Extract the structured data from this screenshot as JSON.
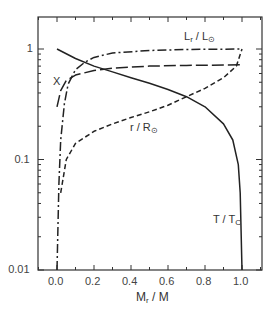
{
  "chart_data": {
    "type": "line",
    "title": "",
    "xlabel": "M_r / M",
    "ylabel": "",
    "xlim": [
      -0.1,
      1.1
    ],
    "ylim": [
      0.01,
      2
    ],
    "yscale": "log",
    "grid": false,
    "legend": "inline labels",
    "xticks": [
      "0.0",
      "0.2",
      "0.4",
      "0.6",
      "0.8",
      "1.0"
    ],
    "yticks": [
      "0.01",
      "0.1",
      "1"
    ],
    "series": [
      {
        "name": "T / T_c",
        "style": "solid",
        "x": [
          0.0,
          0.1,
          0.2,
          0.3,
          0.4,
          0.5,
          0.6,
          0.7,
          0.8,
          0.9,
          0.95,
          0.98,
          0.99,
          1.0
        ],
        "y": [
          1.0,
          0.82,
          0.7,
          0.62,
          0.55,
          0.49,
          0.43,
          0.37,
          0.3,
          0.21,
          0.15,
          0.09,
          0.05,
          0.01
        ]
      },
      {
        "name": "r / R_sun",
        "style": "short-dashed",
        "x": [
          0.02,
          0.05,
          0.1,
          0.2,
          0.3,
          0.4,
          0.5,
          0.6,
          0.7,
          0.8,
          0.9,
          0.97,
          1.0
        ],
        "y": [
          0.05,
          0.1,
          0.14,
          0.18,
          0.21,
          0.24,
          0.27,
          0.31,
          0.37,
          0.44,
          0.55,
          0.7,
          1.0
        ]
      },
      {
        "name": "X",
        "style": "long-dashed",
        "x": [
          0.0,
          0.02,
          0.05,
          0.1,
          0.2,
          0.3,
          0.5,
          0.7,
          1.0
        ],
        "y": [
          0.3,
          0.42,
          0.52,
          0.58,
          0.64,
          0.67,
          0.7,
          0.71,
          0.72
        ]
      },
      {
        "name": "L_r / L_sun",
        "style": "dash-dot",
        "x": [
          0.0,
          0.01,
          0.02,
          0.04,
          0.06,
          0.1,
          0.15,
          0.2,
          0.3,
          0.5,
          0.7,
          1.0
        ],
        "y": [
          0.01,
          0.06,
          0.15,
          0.32,
          0.48,
          0.65,
          0.76,
          0.84,
          0.92,
          0.97,
          0.99,
          1.0
        ]
      }
    ],
    "annotations": [
      {
        "text": "L_r / L_sun",
        "x": 0.78,
        "y": 1.35
      },
      {
        "text": "X",
        "x": -0.03,
        "y": 0.55
      },
      {
        "text": "r / R_sun",
        "x": 0.55,
        "y": 0.21
      },
      {
        "text": "T / T_c",
        "x": 0.92,
        "y": 0.05
      }
    ]
  },
  "labels": {
    "L": "L",
    "L_sub": "r",
    "L_sep": " / L",
    "L_sub2": "⊙",
    "X": "X",
    "r": "r / R",
    "r_sub": "⊙",
    "T": "T / T",
    "T_sub": "C",
    "xlabel_main": "M",
    "xlabel_sub": "r",
    "xlabel_rest": " / M"
  }
}
